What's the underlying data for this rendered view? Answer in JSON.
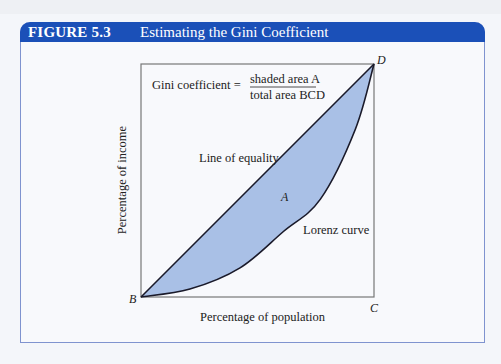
{
  "figure": {
    "number": "FIGURE 5.3",
    "title": "Estimating the Gini Coefficient"
  },
  "diagram": {
    "formula_lhs": "Gini coefficient =",
    "formula_numerator": "shaded area A",
    "formula_denominator": "total area BCD",
    "line_of_equality_label": "Line of equality",
    "lorenz_curve_label": "Lorenz curve",
    "area_label": "A",
    "point_b": "B",
    "point_c": "C",
    "point_d": "D",
    "x_axis_label": "Percentage of population",
    "y_axis_label": "Percentage of income",
    "colors": {
      "header": "#1b50b8",
      "shaded_area": "#a9c0e6",
      "frame_border": "#7f93cf"
    },
    "lorenz_curve_points": [
      {
        "population": 0.0,
        "income": 0.0
      },
      {
        "population": 0.21,
        "income": 0.034
      },
      {
        "population": 0.425,
        "income": 0.125
      },
      {
        "population": 0.61,
        "income": 0.28
      },
      {
        "population": 0.77,
        "income": 0.42
      },
      {
        "population": 0.92,
        "income": 0.72
      },
      {
        "population": 1.0,
        "income": 1.0
      }
    ]
  }
}
